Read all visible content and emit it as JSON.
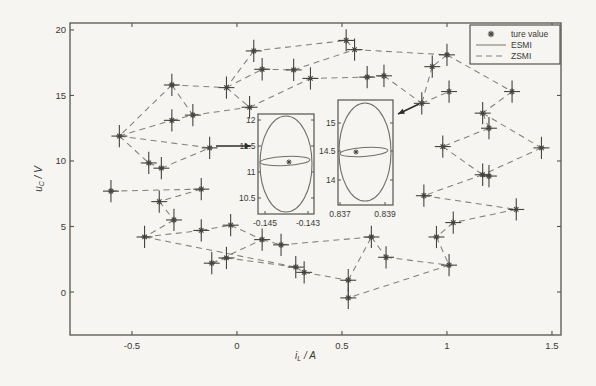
{
  "figure": {
    "bg": "#f6f5f1",
    "frame_color": "#55544e",
    "text_color": "#3a3934",
    "line_color": "#82807a",
    "marker_color": "#45443f",
    "arrow_color": "#2e2d29"
  },
  "chart_data": {
    "type": "scatter",
    "title": "",
    "xlabel": {
      "base": "i",
      "sub": "L",
      "rest": " / A"
    },
    "ylabel": {
      "base": "u",
      "sub": "C",
      "rest": " / V"
    },
    "xlim": [
      -0.795,
      1.543
    ],
    "ylim": [
      -3.28,
      20.53
    ],
    "grid": false,
    "legend_position": "top-right",
    "xticks": [
      {
        "v": -0.5,
        "label": "-0.5"
      },
      {
        "v": 0,
        "label": "0"
      },
      {
        "v": 0.5,
        "label": "0.5"
      },
      {
        "v": 1,
        "label": "1"
      },
      {
        "v": 1.5,
        "label": "1.5"
      }
    ],
    "yticks": [
      {
        "v": 0,
        "label": "0"
      },
      {
        "v": 5,
        "label": "5"
      },
      {
        "v": 10,
        "label": "10"
      },
      {
        "v": 15,
        "label": "15"
      },
      {
        "v": 20,
        "label": "20"
      }
    ],
    "legend": {
      "box": {
        "x": 470,
        "y": 25,
        "w": 90,
        "h": 39
      },
      "entries": [
        {
          "label": "ture value",
          "type": "marker"
        },
        {
          "label": "ESMI",
          "type": "solid"
        },
        {
          "label": "ZSMI",
          "type": "dashed"
        }
      ]
    },
    "series": [
      {
        "name": "ture value",
        "error_x": 0.038,
        "error_y": 0.85,
        "points": [
          [
            0.08,
            18.4
          ],
          [
            0.12,
            17.0
          ],
          [
            0.27,
            16.95
          ],
          [
            0.35,
            16.3
          ],
          [
            -0.31,
            15.8
          ],
          [
            -0.05,
            15.6
          ],
          [
            0.06,
            14.1
          ],
          [
            -0.31,
            13.1
          ],
          [
            -0.21,
            13.5
          ],
          [
            -0.56,
            11.9
          ],
          [
            0.52,
            19.2
          ],
          [
            0.56,
            18.5
          ],
          [
            1.0,
            18.1
          ],
          [
            0.93,
            17.2
          ],
          [
            0.62,
            16.4
          ],
          [
            0.7,
            16.5
          ],
          [
            1.31,
            15.3
          ],
          [
            1.01,
            15.3
          ],
          [
            0.88,
            14.4
          ],
          [
            1.17,
            13.65
          ],
          [
            1.2,
            12.5
          ],
          [
            0.98,
            11.1
          ],
          [
            1.45,
            11.0
          ],
          [
            1.17,
            8.95
          ],
          [
            1.2,
            8.85
          ],
          [
            0.89,
            7.35
          ],
          [
            1.33,
            6.3
          ],
          [
            1.03,
            5.3
          ],
          [
            0.95,
            4.2
          ],
          [
            1.01,
            2.05
          ],
          [
            -0.13,
            11.0
          ],
          [
            -0.42,
            9.85
          ],
          [
            -0.36,
            9.45
          ],
          [
            -0.6,
            7.7
          ],
          [
            -0.17,
            7.85
          ],
          [
            -0.37,
            6.9
          ],
          [
            -0.3,
            5.5
          ],
          [
            -0.44,
            4.2
          ],
          [
            -0.17,
            4.7
          ],
          [
            -0.03,
            5.1
          ],
          [
            0.12,
            4.0
          ],
          [
            0.21,
            3.6
          ],
          [
            -0.12,
            2.2
          ],
          [
            -0.05,
            2.6
          ],
          [
            0.28,
            1.9
          ],
          [
            0.32,
            1.5
          ],
          [
            0.53,
            0.9
          ],
          [
            0.53,
            -0.45
          ],
          [
            0.64,
            4.2
          ],
          [
            0.71,
            2.65
          ]
        ]
      }
    ],
    "path_segments": [
      [
        0,
        10
      ],
      [
        0,
        5
      ],
      [
        5,
        1
      ],
      [
        1,
        2
      ],
      [
        2,
        11
      ],
      [
        10,
        11
      ],
      [
        11,
        12
      ],
      [
        12,
        13
      ],
      [
        12,
        16
      ],
      [
        5,
        6
      ],
      [
        6,
        3
      ],
      [
        3,
        14
      ],
      [
        14,
        15
      ],
      [
        15,
        18
      ],
      [
        18,
        17
      ],
      [
        13,
        18
      ],
      [
        4,
        5
      ],
      [
        4,
        9
      ],
      [
        4,
        8
      ],
      [
        7,
        8
      ],
      [
        8,
        6
      ],
      [
        9,
        7
      ],
      [
        16,
        19
      ],
      [
        19,
        20
      ],
      [
        20,
        21
      ],
      [
        19,
        22
      ],
      [
        22,
        23
      ],
      [
        23,
        24
      ],
      [
        21,
        23
      ],
      [
        23,
        25
      ],
      [
        25,
        26
      ],
      [
        26,
        27
      ],
      [
        27,
        28
      ],
      [
        28,
        29
      ],
      [
        29,
        47
      ],
      [
        46,
        47
      ],
      [
        46,
        48
      ],
      [
        48,
        49
      ],
      [
        49,
        29
      ],
      [
        45,
        46
      ],
      [
        44,
        45
      ],
      [
        43,
        44
      ],
      [
        42,
        43
      ],
      [
        42,
        40
      ],
      [
        40,
        41
      ],
      [
        41,
        48
      ],
      [
        39,
        40
      ],
      [
        38,
        39
      ],
      [
        37,
        38
      ],
      [
        37,
        44
      ],
      [
        36,
        37
      ],
      [
        35,
        36
      ],
      [
        34,
        35
      ],
      [
        33,
        34
      ],
      [
        9,
        31
      ],
      [
        31,
        32
      ],
      [
        32,
        30
      ],
      [
        9,
        30
      ]
    ],
    "insets": [
      {
        "name": "inset-1",
        "box": {
          "x": 258,
          "y": 114,
          "w": 56,
          "h": 100
        },
        "yticks": [
          {
            "label": "12",
            "py": 120
          },
          {
            "label": "11.5",
            "py": 146
          },
          {
            "label": "11",
            "py": 172
          },
          {
            "label": "10.5",
            "py": 198
          }
        ],
        "xticks": [
          {
            "label": "-0.145",
            "px": 265
          },
          {
            "label": "-0.143",
            "px": 308
          }
        ],
        "ellipse": {
          "cx": 286,
          "cy": 164,
          "rx": 26,
          "ry": 48
        },
        "flat_ellipse": {
          "cx": 285,
          "cy": 161,
          "rx": 25,
          "ry": 4.5,
          "rot": -3
        },
        "marker": {
          "px": 289,
          "py": 162
        }
      },
      {
        "name": "inset-2",
        "box": {
          "x": 338,
          "y": 100,
          "w": 55,
          "h": 105
        },
        "yticks": [
          {
            "label": "15",
            "py": 123
          },
          {
            "label": "14.5",
            "py": 151
          },
          {
            "label": "14",
            "py": 180
          }
        ],
        "xticks": [
          {
            "label": "0.837",
            "px": 340
          },
          {
            "label": "0.839",
            "px": 385
          }
        ],
        "ellipse": {
          "cx": 365,
          "cy": 152,
          "rx": 26,
          "ry": 49
        },
        "flat_ellipse": {
          "cx": 364,
          "cy": 152,
          "rx": 24,
          "ry": 4.5,
          "rot": -4
        },
        "marker": {
          "px": 356,
          "py": 152
        }
      }
    ],
    "arrows": [
      {
        "x1": 216,
        "y1": 146,
        "x2": 251,
        "y2": 146
      },
      {
        "x1": 419,
        "y1": 104,
        "x2": 398,
        "y2": 114
      }
    ]
  },
  "plot_area": {
    "left": 70,
    "top": 23,
    "right": 561,
    "bottom": 335
  }
}
